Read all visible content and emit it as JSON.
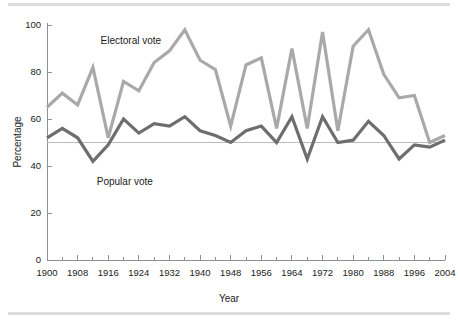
{
  "figure": {
    "background_color": "#ffffff",
    "rule_color": "#d9dde0"
  },
  "axes": {
    "y_title": "Percentage",
    "x_title": "Year",
    "y_ticks": [
      "0",
      "20",
      "40",
      "60",
      "80",
      "100"
    ],
    "x_ticks": [
      "1900",
      "1908",
      "1916",
      "1924",
      "1932",
      "1940",
      "1948",
      "1956",
      "1964",
      "1972",
      "1980",
      "1988",
      "1996",
      "2004"
    ],
    "axis_color": "#8d9194",
    "reference_line_value": "50",
    "reference_line_color": "#b9bcbe"
  },
  "labels": {
    "electoral": "Electoral vote",
    "popular": "Popular vote"
  },
  "chart_data": {
    "type": "line",
    "title": "",
    "subtitle": "",
    "xlabel": "Year",
    "ylabel": "Percentage",
    "xlim": [
      1900,
      2004
    ],
    "ylim": [
      0,
      100
    ],
    "yticks": [
      0,
      20,
      40,
      60,
      80,
      100
    ],
    "xticks": [
      1900,
      1908,
      1916,
      1924,
      1932,
      1940,
      1948,
      1956,
      1964,
      1972,
      1980,
      1988,
      1996,
      2004
    ],
    "minor_x_interval": 4,
    "grid": false,
    "legend": "inline-annotations",
    "reference_line_y": 50,
    "x": [
      1900,
      1904,
      1908,
      1912,
      1916,
      1920,
      1924,
      1928,
      1932,
      1936,
      1940,
      1944,
      1948,
      1952,
      1956,
      1960,
      1964,
      1968,
      1972,
      1976,
      1980,
      1984,
      1988,
      1992,
      1996,
      2000,
      2004
    ],
    "series": [
      {
        "name": "Electoral vote",
        "color": "#a9a9a9",
        "values": [
          65,
          71,
          66,
          82,
          52,
          76,
          72,
          84,
          89,
          98,
          85,
          81,
          57,
          83,
          86,
          56,
          90,
          56,
          97,
          55,
          91,
          98,
          79,
          69,
          70,
          50,
          53
        ]
      },
      {
        "name": "Popular vote",
        "color": "#6e6e6e",
        "values": [
          52,
          56,
          52,
          42,
          49,
          60,
          54,
          58,
          57,
          61,
          55,
          53,
          50,
          55,
          57,
          50,
          61,
          43,
          61,
          50,
          51,
          59,
          53,
          43,
          49,
          48,
          51
        ]
      }
    ],
    "annotations": [
      {
        "text": "Electoral vote",
        "x": 1914,
        "y": 92
      },
      {
        "text": "Popular vote",
        "x": 1913,
        "y": 32
      }
    ]
  }
}
